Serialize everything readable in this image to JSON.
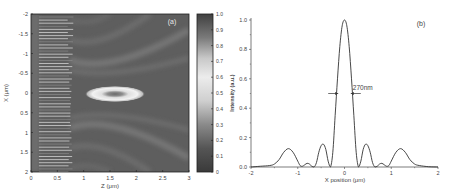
{
  "figure": {
    "panels": [
      "a",
      "b"
    ]
  },
  "chart_data": [
    {
      "type": "heatmap",
      "panel_label": "(a)",
      "title": "",
      "xlabel": "Z (μm)",
      "ylabel": "X (μm)",
      "xlim": [
        0,
        3
      ],
      "ylim": [
        -2,
        2
      ],
      "y_inverted": true,
      "xticks": [
        "0",
        "0.5",
        "1",
        "1.5",
        "2",
        "2.5",
        "3"
      ],
      "yticks": [
        "-2",
        "-1.5",
        "-1",
        "-0.5",
        "0",
        "0.5",
        "1",
        "1.5",
        "2"
      ],
      "colorbar": {
        "range": [
          0,
          1.0
        ],
        "ticks": [
          "0",
          "0.1",
          "0.2",
          "0.3",
          "0.4",
          "0.5",
          "0.6",
          "0.7",
          "0.8",
          "0.9",
          "1.0"
        ],
        "colormap": "grayscale, dark at 0 and 1.0, brightest near 0.6"
      },
      "features": {
        "grating_region_z": [
          0.15,
          0.75
        ],
        "focal_spot": {
          "z_center": 1.55,
          "x_center": 0.0,
          "z_width": 1.1,
          "x_height": 0.3
        },
        "annotation": "focal spot (bright elliptical ring with dark core)"
      },
      "grid": false
    },
    {
      "type": "line",
      "panel_label": "(b)",
      "title": "",
      "xlabel": "X position (μm)",
      "ylabel": "Intensity (a.u.)",
      "xlim": [
        -2,
        2
      ],
      "ylim": [
        0,
        1.0
      ],
      "xticks": [
        "-2",
        "-1",
        "0",
        "1",
        "2"
      ],
      "yticks": [
        "0.0",
        "0.2",
        "0.4",
        "0.6",
        "0.8",
        "1.0"
      ],
      "annotation": {
        "text": "270nm",
        "type": "FWHM arrows",
        "x_left": -0.135,
        "x_right": 0.135,
        "y": 0.5
      },
      "grid": false,
      "legend": null,
      "series": [
        {
          "name": "Intensity profile",
          "x": [
            -2.0,
            -1.8,
            -1.6,
            -1.5,
            -1.4,
            -1.3,
            -1.2,
            -1.1,
            -1.0,
            -0.95,
            -0.9,
            -0.85,
            -0.8,
            -0.75,
            -0.7,
            -0.65,
            -0.6,
            -0.55,
            -0.5,
            -0.45,
            -0.4,
            -0.35,
            -0.3,
            -0.25,
            -0.2,
            -0.15,
            -0.1,
            -0.05,
            0.0,
            0.05,
            0.1,
            0.15,
            0.2,
            0.25,
            0.3,
            0.35,
            0.4,
            0.45,
            0.5,
            0.55,
            0.6,
            0.65,
            0.7,
            0.75,
            0.8,
            0.85,
            0.9,
            0.95,
            1.0,
            1.1,
            1.2,
            1.3,
            1.4,
            1.5,
            1.6,
            1.8,
            2.0
          ],
          "y": [
            0.0,
            0.005,
            0.01,
            0.02,
            0.05,
            0.1,
            0.125,
            0.1,
            0.04,
            0.01,
            0.005,
            0.015,
            0.025,
            0.02,
            0.005,
            0.0,
            0.03,
            0.1,
            0.145,
            0.155,
            0.12,
            0.04,
            0.0,
            0.1,
            0.35,
            0.6,
            0.82,
            0.96,
            1.0,
            0.96,
            0.82,
            0.6,
            0.35,
            0.1,
            0.0,
            0.04,
            0.12,
            0.155,
            0.145,
            0.1,
            0.03,
            0.0,
            0.005,
            0.02,
            0.025,
            0.015,
            0.005,
            0.01,
            0.04,
            0.1,
            0.125,
            0.1,
            0.05,
            0.02,
            0.01,
            0.002,
            0.0
          ]
        }
      ]
    }
  ]
}
